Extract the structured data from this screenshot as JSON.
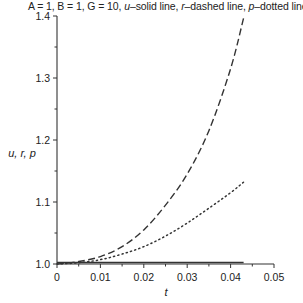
{
  "chart_data": {
    "type": "line",
    "title": "A = 1, B = 1, G = 10, u–solid line, r–dashed line, p–dotted line",
    "title_parts": {
      "params": "A = 1, B = 1, G = 10,",
      "u_label": "u",
      "u_desc": "–solid line,",
      "r_label": "r",
      "r_desc": "–dashed line,",
      "p_label": "p",
      "p_desc": "–dotted line"
    },
    "xlabel": "t",
    "ylabel": "u, r, p",
    "xlim": [
      0,
      0.05
    ],
    "ylim": [
      1.0,
      1.4
    ],
    "xticks": [
      "0",
      "0.01",
      "0.02",
      "0.03",
      "0.04",
      "0.05"
    ],
    "yticks": [
      "1.0",
      "1.1",
      "1.2",
      "1.3",
      "1.4"
    ],
    "grid": false,
    "legend": "in title",
    "series": [
      {
        "name": "u",
        "style": "solid",
        "x": [
          0,
          0.01,
          0.02,
          0.03,
          0.043
        ],
        "values": [
          1.0,
          1.0,
          1.0,
          1.0,
          1.0
        ]
      },
      {
        "name": "r",
        "style": "dashed",
        "x": [
          0,
          0.005,
          0.01,
          0.015,
          0.02,
          0.025,
          0.03,
          0.035,
          0.04,
          0.043
        ],
        "values": [
          1.0,
          1.004,
          1.012,
          1.028,
          1.055,
          1.095,
          1.145,
          1.215,
          1.315,
          1.397
        ]
      },
      {
        "name": "p",
        "style": "dotted",
        "x": [
          0,
          0.005,
          0.01,
          0.015,
          0.02,
          0.025,
          0.03,
          0.035,
          0.04,
          0.043
        ],
        "values": [
          1.0,
          1.002,
          1.007,
          1.016,
          1.028,
          1.045,
          1.066,
          1.09,
          1.115,
          1.132
        ]
      }
    ]
  }
}
